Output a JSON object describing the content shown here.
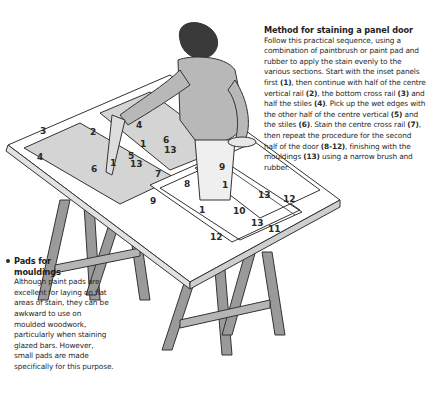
{
  "method": {
    "title": "Method for staining a panel door",
    "body_parts": [
      "Follow this practical sequence, using a combination of paintbrush or paint pad and rubber to apply the stain evenly to the various sections. Start with the inset panels first ",
      "(1)",
      ", then continue with half of the centre vertical rail ",
      "(2)",
      ", the bottom cross rail ",
      "(3)",
      " and half the stiles ",
      "(4)",
      ". Pick up the wet edges with the other half of the centre vertical ",
      "(5)",
      " and the stiles ",
      "(6)",
      ". Stain the centre cross rail ",
      "(7)",
      ", then repeat the procedure for the second half of the door ",
      "(8-12)",
      ", finishing with the mouldings ",
      "(13)",
      " using a narrow brush and rubber."
    ]
  },
  "pads": {
    "title_line1": "Pads for",
    "title_line2": "mouldings",
    "body": "Although paint pads are excellent for laying on flat areas of stain, they can be awkward to use on moulded woodwork, particularly when staining glazed bars. However, small pads are made specifically for this purpose."
  },
  "diagram_labels": {
    "l3": "3",
    "l2": "2",
    "l4a": "4",
    "l6a": "6",
    "l1a": "1",
    "l5": "5",
    "l13a": "13",
    "l4b": "4",
    "l6b": "6",
    "l1b": "1",
    "l13b": "13",
    "l7": "7",
    "l9a": "9",
    "l1c": "1",
    "l13c": "13",
    "l12a": "12",
    "l8": "8",
    "l9b": "9",
    "l1d": "1",
    "l10": "10",
    "l13d": "13",
    "l11": "11",
    "l12b": "12"
  }
}
